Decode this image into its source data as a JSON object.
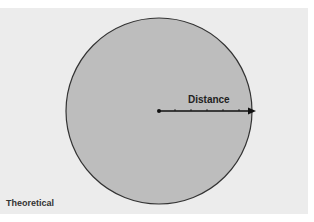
{
  "diagram": {
    "distance_label": "Distance",
    "caption": "Theoretical",
    "colors": {
      "background": "#ececec",
      "circle_fill": "#bdbdbd",
      "circle_stroke": "#333333",
      "arrow": "#111111"
    },
    "circle": {
      "cx": 159,
      "cy": 111,
      "r": 93
    },
    "arrow": {
      "x1": 159,
      "y1": 111,
      "x2": 255,
      "y2": 111,
      "ticks": 5
    }
  }
}
